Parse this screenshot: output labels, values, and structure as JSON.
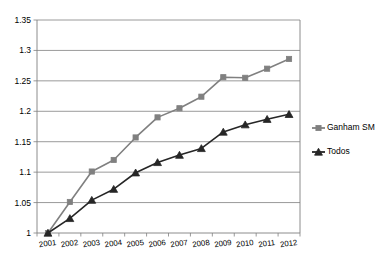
{
  "chart_data": {
    "type": "line",
    "title": "",
    "subtitle": "",
    "xlabel": "",
    "ylabel": "",
    "categories": [
      "2001",
      "2002",
      "2003",
      "2004",
      "2005",
      "2006",
      "2007",
      "2008",
      "2009",
      "2010",
      "2011",
      "2012"
    ],
    "ylim": [
      1,
      1.35
    ],
    "ytick_labels": [
      "1",
      "1.05",
      "1.1",
      "1.15",
      "1.2",
      "1.25",
      "1.3",
      "1.35"
    ],
    "ytick_values": [
      1,
      1.05,
      1.1,
      1.15,
      1.2,
      1.25,
      1.3,
      1.35
    ],
    "grid": true,
    "legend_position": "right",
    "series": [
      {
        "name": "Ganham SM",
        "marker": "square",
        "color": "#808080",
        "values": [
          1.0,
          1.051,
          1.101,
          1.12,
          1.157,
          1.19,
          1.205,
          1.224,
          1.256,
          1.255,
          1.27,
          1.286
        ]
      },
      {
        "name": "Todos",
        "marker": "triangle",
        "color": "#262626",
        "values": [
          1.0,
          1.024,
          1.054,
          1.072,
          1.099,
          1.116,
          1.128,
          1.139,
          1.166,
          1.178,
          1.187,
          1.195
        ]
      }
    ]
  },
  "legend": {
    "entries": [
      {
        "label": "Ganham SM"
      },
      {
        "label": "Todos"
      }
    ]
  },
  "colors": {
    "series_ganham": "#808080",
    "series_todos": "#262626",
    "grid": "#808080",
    "axis": "#808080",
    "text": "#000000",
    "background": "#ffffff"
  }
}
